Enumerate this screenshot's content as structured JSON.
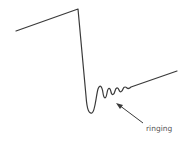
{
  "diagram": {
    "label": "ringing",
    "colors": {
      "line": "#3a3a3a",
      "text": "#555555",
      "background": "#ffffff"
    }
  }
}
